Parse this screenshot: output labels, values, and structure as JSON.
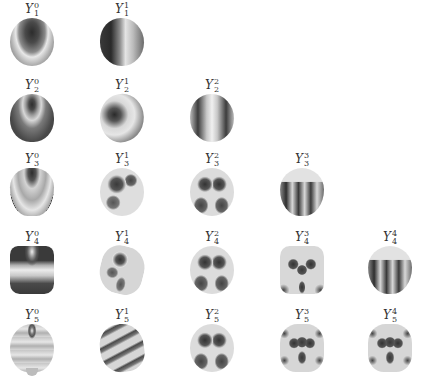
{
  "figure": {
    "rows": [
      {
        "l": 1,
        "cells": [
          {
            "symbol": "Y",
            "sup": "0",
            "sub": "1",
            "style": "s-sphere-band"
          },
          {
            "symbol": "Y",
            "sup": "1",
            "sub": "1",
            "style": "s-sphere-side"
          }
        ]
      },
      {
        "l": 2,
        "cells": [
          {
            "symbol": "Y",
            "sup": "0",
            "sub": "2",
            "style": "s-oblate"
          },
          {
            "symbol": "Y",
            "sup": "1",
            "sub": "2",
            "style": "s-tilt1"
          },
          {
            "symbol": "Y",
            "sup": "2",
            "sub": "2",
            "style": "s-lobes2"
          }
        ]
      },
      {
        "l": 3,
        "cells": [
          {
            "symbol": "Y",
            "sup": "0",
            "sub": "3",
            "style": "s-top3"
          },
          {
            "symbol": "Y",
            "sup": "1",
            "sub": "3",
            "style": "s-patch"
          },
          {
            "symbol": "Y",
            "sup": "2",
            "sub": "3",
            "style": "s-patch4"
          },
          {
            "symbol": "Y",
            "sup": "3",
            "sub": "3",
            "style": "s-fingers"
          }
        ]
      },
      {
        "l": 4,
        "cells": [
          {
            "symbol": "Y",
            "sup": "0",
            "sub": "4",
            "style": "s-drum"
          },
          {
            "symbol": "Y",
            "sup": "1",
            "sub": "4",
            "style": "s-spinpatch"
          },
          {
            "symbol": "Y",
            "sup": "2",
            "sub": "4",
            "style": "s-patch4"
          },
          {
            "symbol": "Y",
            "sup": "3",
            "sub": "4",
            "style": "s-box"
          },
          {
            "symbol": "Y",
            "sup": "4",
            "sub": "4",
            "style": "s-fingers"
          }
        ]
      },
      {
        "l": 5,
        "cells": [
          {
            "symbol": "Y",
            "sup": "0",
            "sub": "5",
            "style": "s-bell"
          },
          {
            "symbol": "Y",
            "sup": "1",
            "sub": "5",
            "style": "s-stripes"
          },
          {
            "symbol": "Y",
            "sup": "2",
            "sub": "5",
            "style": "s-patch4"
          },
          {
            "symbol": "Y",
            "sup": "3",
            "sub": "5",
            "style": "s-penta"
          },
          {
            "symbol": "Y",
            "sup": "4",
            "sub": "5",
            "style": "s-penta"
          }
        ]
      }
    ]
  }
}
